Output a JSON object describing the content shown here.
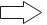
{
  "icon": {
    "name": "right-arrow-icon",
    "direction": "right",
    "fill": "#ffffff",
    "stroke": "#1a1a1a"
  }
}
